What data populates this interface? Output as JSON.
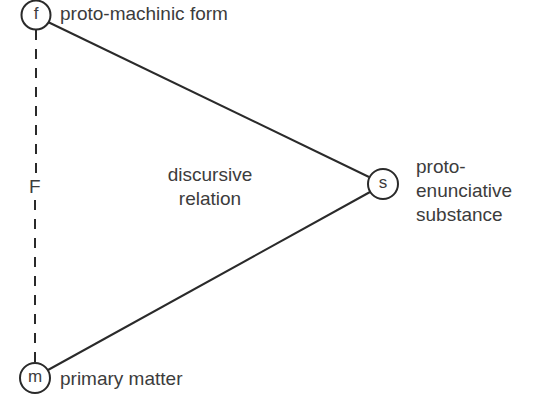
{
  "diagram": {
    "nodes": [
      {
        "id": "f",
        "letter": "f",
        "label": "proto-machinic form"
      },
      {
        "id": "s",
        "letter": "s",
        "label_lines": [
          "proto-",
          "enunciative",
          "substance"
        ]
      },
      {
        "id": "m",
        "letter": "m",
        "label": "primary matter"
      }
    ],
    "edges": [
      {
        "from": "f",
        "to": "s",
        "style": "solid"
      },
      {
        "from": "m",
        "to": "s",
        "style": "solid"
      },
      {
        "from": "f",
        "to": "m",
        "style": "dashed",
        "label": "F"
      }
    ],
    "center_label_lines": [
      "discursive",
      "relation"
    ],
    "colors": {
      "stroke": "#2a2a2a",
      "text": "#3c3c3c",
      "background": "#ffffff"
    }
  }
}
